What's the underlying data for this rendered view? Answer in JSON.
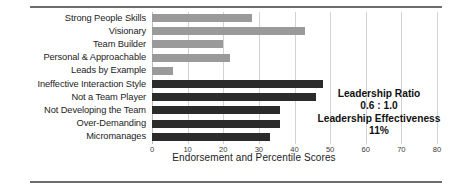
{
  "chart_data": {
    "type": "bar",
    "orientation": "horizontal",
    "title": "",
    "xlabel": "Endorsement and Percentile Scores",
    "ylabel": "",
    "xlim": [
      0,
      80
    ],
    "xticks": [
      0,
      10,
      20,
      30,
      40,
      50,
      60,
      70,
      80
    ],
    "grid": true,
    "legend": "none",
    "categories": [
      "Strong People Skills",
      "Visionary",
      "Team Builder",
      "Personal & Approachable",
      "Leads by Example",
      "Ineffective Interaction Style",
      "Not a Team Player",
      "Not Developing the Team",
      "Over-Demanding",
      "Micromanages"
    ],
    "values": [
      28,
      43,
      20,
      22,
      6,
      48,
      46,
      36,
      36,
      33
    ],
    "bar_groups": [
      "positive",
      "positive",
      "positive",
      "positive",
      "positive",
      "negative",
      "negative",
      "negative",
      "negative",
      "negative"
    ],
    "colors": {
      "positive": "#9a9a9a",
      "negative": "#2b2b2b",
      "gridline": "#d2d2d2",
      "text": "#1c1c1c"
    }
  },
  "annotation": {
    "ratio_label": "Leadership Ratio",
    "ratio_value": "0.6 : 1.0",
    "effectiveness_label": "Leadership Effectiveness",
    "effectiveness_value": "11%"
  }
}
